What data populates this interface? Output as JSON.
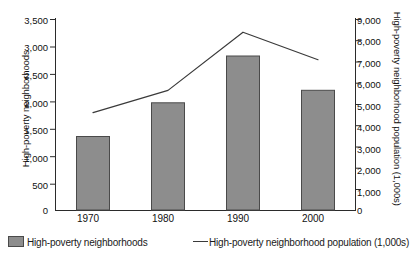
{
  "chart_data": {
    "type": "bar",
    "title": "",
    "subtitle": "",
    "xlabel": "",
    "categories": [
      "1970",
      "1980",
      "1990",
      "2000"
    ],
    "grid": false,
    "legend_position": "bottom",
    "series": [
      {
        "name": "High-poverty neighborhoods",
        "type": "bar",
        "axis": "left",
        "values": [
          1350,
          1970,
          2830,
          2200
        ],
        "color": "#8d8d8d"
      },
      {
        "name": "High-poverty neighborhood population (1,000s)",
        "type": "line",
        "axis": "right",
        "values": [
          4600,
          5650,
          8400,
          7100
        ],
        "color": "#3a3a3a"
      }
    ],
    "left_axis": {
      "label": "High-poverty neighborhoods",
      "ylim": [
        0,
        3500
      ],
      "ticks": [
        0,
        500,
        1000,
        1500,
        2000,
        2500,
        3000,
        3500
      ],
      "tick_labels": [
        "0",
        "500",
        "1,000",
        "1,500",
        "2,000",
        "2,500",
        "3,000",
        "3,500"
      ]
    },
    "right_axis": {
      "label": "High-poverty neighborhood population (1,000s)",
      "ylim": [
        0,
        9000
      ],
      "ticks": [
        0,
        1000,
        2000,
        3000,
        4000,
        5000,
        6000,
        7000,
        8000,
        9000
      ],
      "tick_labels": [
        "0",
        "1,000",
        "2,000",
        "3,000",
        "4,000",
        "5,000",
        "6,000",
        "7,000",
        "8,000",
        "9,000"
      ]
    }
  },
  "legend": {
    "bar_label": "High-poverty neighborhoods",
    "line_label": "High-poverty neighborhood population (1,000s)",
    "line_dash": "—"
  }
}
